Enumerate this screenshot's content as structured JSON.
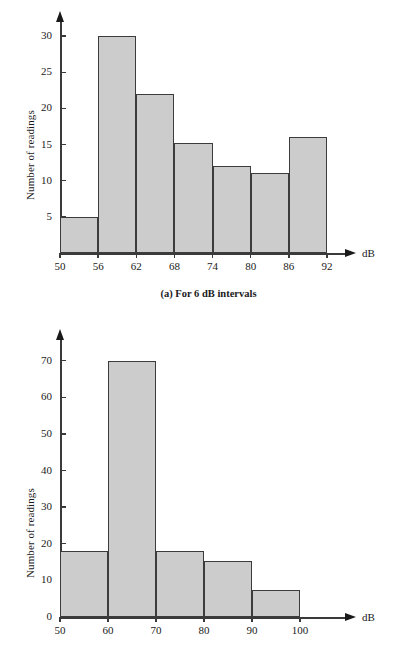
{
  "chart_data": [
    {
      "id": "a",
      "type": "bar",
      "title": "",
      "caption": "(a) For 6 dB intervals",
      "xlabel": "dB",
      "ylabel": "Number of readings",
      "bin_edges": [
        50,
        56,
        62,
        68,
        74,
        80,
        86,
        92
      ],
      "categories": [
        "50-56",
        "56-62",
        "62-68",
        "68-74",
        "74-80",
        "80-86",
        "86-92"
      ],
      "values": [
        5,
        30,
        22,
        15.2,
        12,
        11,
        16
      ],
      "xticklabels": [
        "50",
        "56",
        "62",
        "68",
        "74",
        "80",
        "86",
        "92"
      ],
      "yticks": [
        5,
        10,
        15,
        20,
        25,
        30
      ],
      "yticklabels": [
        "5",
        "10",
        "15",
        "20",
        "25",
        "30"
      ],
      "xlim": [
        50,
        92
      ],
      "ylim": [
        0,
        32.5
      ],
      "grid": false,
      "legend": "none",
      "bar_fill": "#cccccc",
      "bar_edge": "#3c3c3c",
      "axis_color": "#3a3a3a"
    },
    {
      "id": "b",
      "type": "bar",
      "title": "",
      "caption": "",
      "xlabel": "dB",
      "ylabel": "Number of readings",
      "bin_edges": [
        50,
        60,
        70,
        80,
        90,
        100
      ],
      "categories": [
        "50-60",
        "60-70",
        "70-80",
        "80-90",
        "90-100"
      ],
      "values": [
        18,
        70,
        18,
        15.2,
        7.5
      ],
      "xticklabels": [
        "50",
        "60",
        "70",
        "80",
        "90",
        "100"
      ],
      "yticks": [
        0,
        10,
        20,
        30,
        40,
        50,
        60,
        70
      ],
      "yticklabels": [
        "0",
        "10",
        "20",
        "30",
        "40",
        "50",
        "60",
        "70"
      ],
      "xlim": [
        50,
        100
      ],
      "ylim": [
        0,
        74
      ],
      "grid": false,
      "legend": "none",
      "bar_fill": "#cccccc",
      "bar_edge": "#3c3c3c",
      "axis_color": "#3a3a3a"
    }
  ]
}
